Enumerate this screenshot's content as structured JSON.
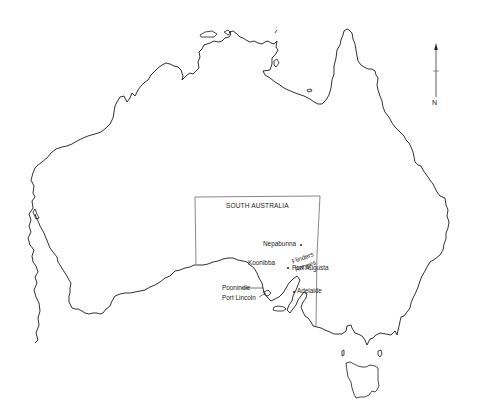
{
  "map": {
    "title": "Map of Australia showing South Australia",
    "region_label": "SOUTH AUSTRALIA",
    "north_label": "N",
    "places": [
      {
        "name": "Nepabunna",
        "marker": "dot"
      },
      {
        "name": "Flinders",
        "marker": "none"
      },
      {
        "name": "Ranges",
        "marker": "none"
      },
      {
        "name": "Koonibba",
        "marker": "none"
      },
      {
        "name": "Port Augusta",
        "marker": "dot"
      },
      {
        "name": "Poonindie",
        "marker": "leader-line"
      },
      {
        "name": "Port Lincoln",
        "marker": "leader-line"
      },
      {
        "name": "Adelaide",
        "marker": "dot"
      }
    ],
    "colors": {
      "background": "#ffffff",
      "coastline": "#1a1a1a",
      "state_border": "#555555",
      "text": "#222222"
    }
  }
}
